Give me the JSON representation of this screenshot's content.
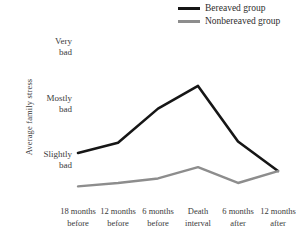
{
  "chart_data": {
    "type": "line",
    "title": "",
    "xlabel": "",
    "ylabel": "Average family stress",
    "categories": [
      "18 months before",
      "12 months before",
      "6 months before",
      "Death interval",
      "6 months after",
      "12 months after"
    ],
    "category_lines": [
      [
        "18 months",
        "before"
      ],
      [
        "12 months",
        "before"
      ],
      [
        "6 months",
        "before"
      ],
      [
        "Death",
        "interval"
      ],
      [
        "6 months",
        "after"
      ],
      [
        "12 months",
        "after"
      ]
    ],
    "ytick_labels": [
      "Very bad",
      "Mostly bad",
      "Slightly bad"
    ],
    "ytick_lines": [
      [
        "Very",
        "bad"
      ],
      [
        "Mostly",
        "bad"
      ],
      [
        "Slightly",
        "bad"
      ]
    ],
    "ytick_values": [
      3,
      2,
      1
    ],
    "ylim": [
      0.25,
      3.35
    ],
    "grid": false,
    "legend_position": "top-right",
    "series": [
      {
        "name": "Bereaved group",
        "color": "#161616",
        "width": 2.6,
        "values": [
          1.15,
          1.33,
          1.93,
          2.33,
          1.35,
          0.83
        ]
      },
      {
        "name": "Nonbereaved group",
        "color": "#8d8d8d",
        "width": 2.4,
        "values": [
          0.56,
          0.62,
          0.7,
          0.9,
          0.62,
          0.83
        ]
      }
    ]
  },
  "legend": {
    "items": [
      {
        "label": "Bereaved group",
        "swatch": "series-bereaved"
      },
      {
        "label": "Nonbereaved group",
        "swatch": "series-nonbereaved"
      }
    ]
  },
  "axes": {
    "y_title": "Average family stress"
  },
  "colors": {
    "background": "#ffffff",
    "text": "#3b3b3b",
    "bereaved": "#161616",
    "nonbereaved": "#8d8d8d"
  }
}
